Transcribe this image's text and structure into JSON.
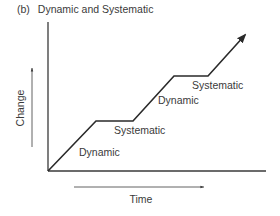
{
  "figure": {
    "panel_tag": "(b)",
    "title": "Dynamic and Systematic"
  },
  "axes": {
    "y_label": "Change",
    "x_label": "Time"
  },
  "segments": [
    {
      "label": "Dynamic",
      "type": "rising"
    },
    {
      "label": "Systematic",
      "type": "plateau"
    },
    {
      "label": "Dynamic",
      "type": "rising"
    },
    {
      "label": "Systematic",
      "type": "plateau"
    }
  ],
  "colors": {
    "line": "#2a2a2a",
    "axis": "#3a3a3a",
    "text": "#3a3a3a"
  }
}
